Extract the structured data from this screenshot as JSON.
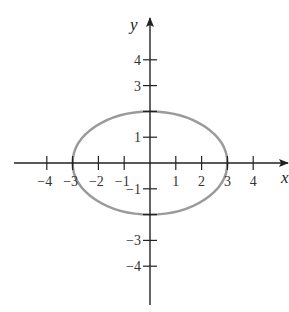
{
  "chart_data": {
    "type": "line",
    "title": "",
    "equation": "x^2/9 + y^2/4 = 1",
    "xlabel": "x",
    "ylabel": "y",
    "xlim": [
      -5,
      5.5
    ],
    "ylim": [
      -5.5,
      5.5
    ],
    "grid": false,
    "legend": null,
    "x_ticks": [
      -4,
      -3,
      -2,
      -1,
      1,
      2,
      3,
      4
    ],
    "x_tick_labels": [
      "−4",
      "−3",
      "−2",
      "−1",
      "1",
      "2",
      "3",
      "4"
    ],
    "y_ticks": [
      4,
      3,
      1,
      -1,
      -3,
      -4
    ],
    "y_tick_labels": [
      "4",
      "3",
      "1",
      "−1",
      "−3",
      "−4"
    ],
    "series": [
      {
        "name": "ellipse",
        "shape": "ellipse",
        "center": [
          0,
          0
        ],
        "semi_axis_x": 3,
        "semi_axis_y": 2,
        "points": [
          [
            3,
            0
          ],
          [
            0,
            2
          ],
          [
            -3,
            0
          ],
          [
            0,
            -2
          ]
        ]
      }
    ],
    "colors": {
      "curve": "#9a9a9a",
      "axes": "#222222"
    }
  }
}
